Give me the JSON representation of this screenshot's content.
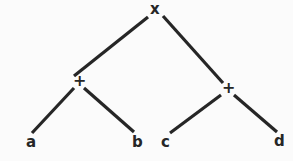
{
  "diagram": {
    "background_color": "#fbfbfb",
    "ink_color": "#262626",
    "nodes": {
      "root": {
        "label": "x",
        "kind": "operator",
        "x": 155,
        "y": 10
      },
      "left_op": {
        "label": "+",
        "kind": "operator",
        "x": 79,
        "y": 82
      },
      "right_op": {
        "label": "+",
        "kind": "operator",
        "x": 228,
        "y": 89
      },
      "leaf_a": {
        "label": "a",
        "kind": "operand",
        "x": 31,
        "y": 143
      },
      "leaf_b": {
        "label": "b",
        "kind": "operand",
        "x": 137,
        "y": 143
      },
      "leaf_c": {
        "label": "c",
        "kind": "operand",
        "x": 165,
        "y": 143
      },
      "leaf_d": {
        "label": "d",
        "kind": "operand",
        "x": 278,
        "y": 142
      }
    },
    "edges": [
      {
        "name": "root-to-left-op",
        "from": "root",
        "to": "left_op",
        "x1": 148,
        "y1": 17,
        "x2": 74,
        "y2": 76
      },
      {
        "name": "root-to-right-op",
        "from": "root",
        "to": "right_op",
        "x1": 163,
        "y1": 16,
        "x2": 223,
        "y2": 83
      },
      {
        "name": "left-op-to-a",
        "from": "left_op",
        "to": "leaf_a",
        "x1": 74,
        "y1": 88,
        "x2": 32,
        "y2": 133
      },
      {
        "name": "left-op-to-b",
        "from": "left_op",
        "to": "leaf_b",
        "x1": 84,
        "y1": 88,
        "x2": 134,
        "y2": 132
      },
      {
        "name": "right-op-to-c",
        "from": "right_op",
        "to": "leaf_c",
        "x1": 221,
        "y1": 95,
        "x2": 170,
        "y2": 133
      },
      {
        "name": "right-op-to-d",
        "from": "right_op",
        "to": "leaf_d",
        "x1": 234,
        "y1": 95,
        "x2": 277,
        "y2": 132
      }
    ]
  }
}
